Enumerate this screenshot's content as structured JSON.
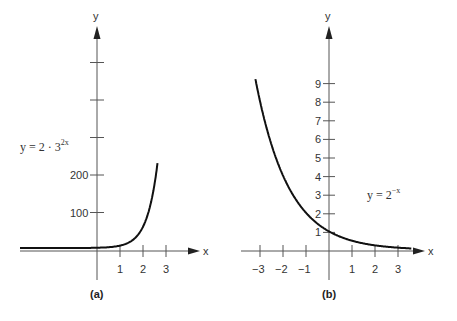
{
  "chart_data": [
    {
      "type": "line",
      "caption": "(a)",
      "equation": "y = 2 · 3^(2x)",
      "equation_base": "y = 2 · 3",
      "equation_exp": "2x",
      "xlabel": "x",
      "ylabel": "y",
      "x_ticks": [
        "1",
        "2",
        "3"
      ],
      "y_ticks": [
        "100",
        "200"
      ],
      "y_unlabeled_ticks": [
        300,
        400,
        500
      ],
      "xlim": [
        -4.2,
        3.8
      ],
      "ylim": [
        -80,
        580
      ],
      "series": [
        {
          "name": "y = 2·3^(2x)",
          "x": [
            -4.2,
            -2,
            -1,
            0,
            0.5,
            1,
            1.5,
            2,
            2.5,
            2.7
          ],
          "y": [
            0,
            0.02,
            0.22,
            2,
            6,
            18,
            54,
            162,
            486,
            500
          ]
        }
      ]
    },
    {
      "type": "line",
      "caption": "(b)",
      "equation": "y = 2^(-x)",
      "equation_base": "y = 2",
      "equation_exp": "−x",
      "xlabel": "x",
      "ylabel": "y",
      "x_ticks": [
        "−3",
        "−2",
        "−1",
        "1",
        "2",
        "3"
      ],
      "y_ticks": [
        "1",
        "2",
        "3",
        "4",
        "5",
        "6",
        "7",
        "8",
        "9"
      ],
      "xlim": [
        -3.2,
        3.6
      ],
      "ylim": [
        -1,
        10.5
      ],
      "series": [
        {
          "name": "y = 2^(-x)",
          "x": [
            -3.2,
            -3,
            -2,
            -1,
            0,
            1,
            2,
            3,
            3.6
          ],
          "y": [
            9.19,
            8,
            4,
            2,
            1,
            0.5,
            0.25,
            0.125,
            0.08
          ]
        }
      ]
    }
  ]
}
